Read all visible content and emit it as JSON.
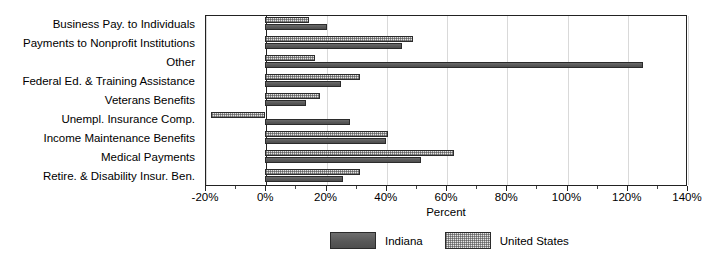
{
  "chart_data": {
    "type": "bar",
    "orientation": "horizontal",
    "title": "",
    "xlabel": "Percent",
    "ylabel": "",
    "xlim": [
      -20,
      140
    ],
    "xticks": [
      -20,
      0,
      20,
      40,
      60,
      80,
      100,
      120,
      140
    ],
    "xticklabels": [
      "-20%",
      "0%",
      "20%",
      "40%",
      "60%",
      "80%",
      "100%",
      "120%",
      "140%"
    ],
    "grid": true,
    "legend_position": "bottom-center",
    "categories": [
      "Business Pay. to Individuals",
      "Payments to Nonprofit Institutions",
      "Other",
      "Federal Ed. & Training Assistance",
      "Veterans Benefits",
      "Unempl. Insurance Comp.",
      "Income Maintenance Benefits",
      "Medical Payments",
      "Retire. & Disability Insur. Ben."
    ],
    "series": [
      {
        "name": "Indiana",
        "color": "#5e5e5e",
        "pattern": "solid",
        "values": [
          20.5,
          45.3,
          125.3,
          25.2,
          13.5,
          28.2,
          40.1,
          51.8,
          25.8
        ]
      },
      {
        "name": "United States",
        "color": "#e3e3e3",
        "pattern": "dotted",
        "values": [
          14.4,
          49.1,
          16.6,
          31.5,
          18.2,
          -18.0,
          40.6,
          62.7,
          31.5
        ]
      }
    ]
  },
  "legend": {
    "items": [
      {
        "label": "Indiana",
        "swatch": "indiana-swatch"
      },
      {
        "label": "United States",
        "swatch": "united-states-swatch"
      }
    ]
  },
  "axis": {
    "x_title": "Percent"
  }
}
